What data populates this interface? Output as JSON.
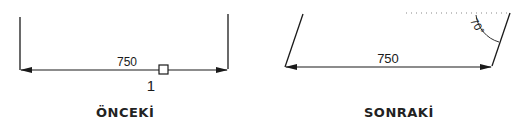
{
  "before": {
    "dimension": "750",
    "marker": "1",
    "caption": "ÖNCEKİ"
  },
  "after": {
    "dimension": "750",
    "angle": "70°",
    "caption": "SONRAKİ"
  },
  "colors": {
    "line": "#1a1a1a",
    "dotted": "#888888"
  }
}
